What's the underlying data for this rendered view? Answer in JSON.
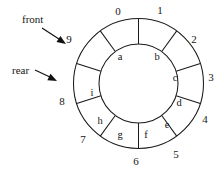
{
  "figure": {
    "type": "circular-queue-ring-diagram",
    "background_color": "#ffffff",
    "stroke_color": "#1a1a1a",
    "text_color": "#161616",
    "geometry": {
      "center_x": 138.5,
      "center_y": 83.5,
      "outer_radius": 65,
      "inner_radius": 39.5,
      "slot_count": 10,
      "degrees_per_slot": 36,
      "first_boundary_angle_deg": -90
    }
  },
  "ring": {
    "slots": [
      {
        "index": 0,
        "label": "a",
        "filled": true,
        "letter_x": 120,
        "letter_y": 58
      },
      {
        "index": 1,
        "label": "b",
        "filled": true,
        "letter_x": 157,
        "letter_y": 58
      },
      {
        "index": 2,
        "label": "c",
        "filled": true,
        "letter_x": 175,
        "letter_y": 79
      },
      {
        "index": 3,
        "label": "d",
        "filled": true,
        "letter_x": 179,
        "letter_y": 104
      },
      {
        "index": 4,
        "label": "e",
        "filled": true,
        "letter_x": 167,
        "letter_y": 126
      },
      {
        "index": 5,
        "label": "f",
        "filled": true,
        "letter_x": 146,
        "letter_y": 136
      },
      {
        "index": 6,
        "label": "g",
        "filled": true,
        "letter_x": 120,
        "letter_y": 136
      },
      {
        "index": 7,
        "label": "h",
        "filled": true,
        "letter_x": 100,
        "letter_y": 122
      },
      {
        "index": 8,
        "label": "i",
        "filled": true,
        "letter_x": 92,
        "letter_y": 94
      },
      {
        "index": 9,
        "label": "",
        "filled": false,
        "letter_x": 99,
        "letter_y": 60
      }
    ],
    "boundary_numbers": [
      {
        "value": "0",
        "x": 118,
        "y": 12
      },
      {
        "value": "1",
        "x": 160,
        "y": 11
      },
      {
        "value": "2",
        "x": 194,
        "y": 40
      },
      {
        "value": "3",
        "x": 211,
        "y": 78
      },
      {
        "value": "4",
        "x": 205,
        "y": 120
      },
      {
        "value": "5",
        "x": 176,
        "y": 155
      },
      {
        "value": "6",
        "x": 136,
        "y": 162
      },
      {
        "value": "7",
        "x": 83,
        "y": 140
      },
      {
        "value": "8",
        "x": 62,
        "y": 102
      },
      {
        "value": "9",
        "x": 69,
        "y": 40
      }
    ]
  },
  "pointers": [
    {
      "name": "front",
      "label": "front",
      "label_x": 22,
      "label_y": 20,
      "points_to_index": "9",
      "shaft": {
        "x1": 42,
        "y1": 28,
        "x2": 62,
        "y2": 41
      },
      "head": {
        "tip_x": 66,
        "tip_y": 44,
        "angle_deg": 33
      }
    },
    {
      "name": "rear",
      "label": "rear",
      "label_x": 12,
      "label_y": 71,
      "points_to_index": "8",
      "shaft": {
        "x1": 35,
        "y1": 70,
        "x2": 52,
        "y2": 78
      },
      "head": {
        "tip_x": 57,
        "tip_y": 81,
        "angle_deg": 26
      }
    }
  ]
}
